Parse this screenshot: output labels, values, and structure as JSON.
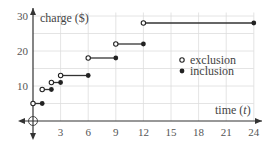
{
  "chart_data": {
    "type": "line",
    "title": "",
    "xlabel": "time (t)",
    "ylabel": "charge ($)",
    "xlim": [
      0,
      24
    ],
    "ylim": [
      0,
      30
    ],
    "x_ticks": [
      3,
      6,
      9,
      12,
      15,
      18,
      21,
      24
    ],
    "y_ticks": [
      10,
      20,
      30
    ],
    "grid": true,
    "legend": {
      "position": "right-middle",
      "entries": [
        {
          "marker": "open-circle",
          "label": "exclusion"
        },
        {
          "marker": "filled-circle",
          "label": "inclusion"
        }
      ]
    },
    "series": [
      {
        "name": "step charge",
        "segments": [
          {
            "x_start": 0,
            "x_end": 1,
            "y": 5,
            "start": "open",
            "end": "closed"
          },
          {
            "x_start": 1,
            "x_end": 2,
            "y": 9,
            "start": "open",
            "end": "closed"
          },
          {
            "x_start": 2,
            "x_end": 3,
            "y": 11,
            "start": "open",
            "end": "closed"
          },
          {
            "x_start": 3,
            "x_end": 6,
            "y": 13,
            "start": "open",
            "end": "closed"
          },
          {
            "x_start": 6,
            "x_end": 9,
            "y": 18,
            "start": "open",
            "end": "closed"
          },
          {
            "x_start": 9,
            "x_end": 12,
            "y": 22,
            "start": "open",
            "end": "closed"
          },
          {
            "x_start": 12,
            "x_end": 24,
            "y": 28,
            "start": "open",
            "end": "closed"
          }
        ]
      }
    ]
  },
  "labels": {
    "ylabel": "charge ($)",
    "xlabel_prefix": "time (",
    "xlabel_var": "t",
    "xlabel_suffix": ")",
    "legend_exclusion": "exclusion",
    "legend_inclusion": "inclusion",
    "xt": [
      "3",
      "6",
      "9",
      "12",
      "15",
      "18",
      "21",
      "24"
    ],
    "yt": [
      "10",
      "20",
      "30"
    ]
  }
}
